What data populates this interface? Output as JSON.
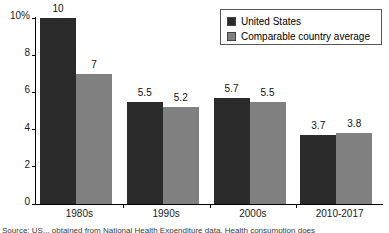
{
  "chart_data": {
    "type": "bar",
    "title": "",
    "xlabel": "",
    "ylabel": "",
    "ylim": [
      0,
      10
    ],
    "yticks": [
      {
        "value": 10,
        "label": "10%"
      },
      {
        "value": 8,
        "label": "8"
      },
      {
        "value": 6,
        "label": "6"
      },
      {
        "value": 4,
        "label": "4"
      },
      {
        "value": 2,
        "label": "2"
      },
      {
        "value": 0,
        "label": "0"
      }
    ],
    "grid": false,
    "legend_position": "top-right",
    "categories": [
      "1980s",
      "1990s",
      "2000s",
      "2010-2017"
    ],
    "series": [
      {
        "name": "United States",
        "color": "#2b2b2b",
        "values": [
          10,
          5.5,
          5.7,
          3.7
        ],
        "labels": [
          "10",
          "5.5",
          "5.7",
          "3.7"
        ]
      },
      {
        "name": "Comparable country average",
        "color": "#808080",
        "values": [
          7,
          5.2,
          5.5,
          3.8
        ],
        "labels": [
          "7",
          "5.2",
          "5.5",
          "3.8"
        ]
      }
    ]
  },
  "legend": {
    "items": [
      {
        "label": "United States",
        "color": "#2b2b2b"
      },
      {
        "label": "Comparable country average",
        "color": "#808080"
      }
    ]
  },
  "footnote": {
    "text": "Source: US... obtained from National Health Expenditure data. Health consumption does"
  }
}
